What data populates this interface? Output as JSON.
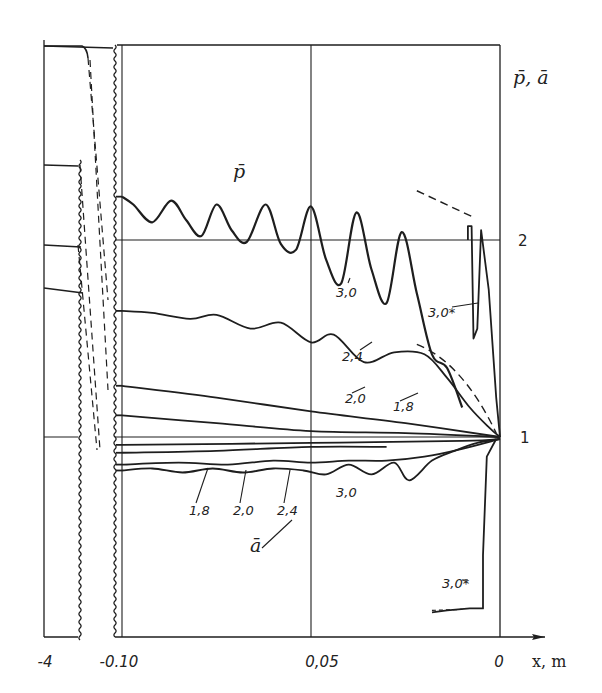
{
  "chart_data": {
    "type": "line",
    "title": "",
    "xlabel": "x, m",
    "ylabel": "p̄, ā",
    "xlim": [
      -0.1,
      0
    ],
    "ylim": [
      0,
      3
    ],
    "grid": true,
    "x_ticks": [
      "-4",
      "-0.10",
      "0,05",
      "0"
    ],
    "x_tick_values": [
      -4,
      -0.1,
      -0.05,
      0
    ],
    "y_ticks": [
      "1",
      "2"
    ],
    "y_tick_values": [
      1,
      2
    ],
    "x_axis_break": "between -4 and -0.10 (broken axis with inset segment at x=-4)",
    "group_labels": {
      "p": "p̄",
      "a": "ā"
    },
    "series": [
      {
        "name": "p̄ 3,0",
        "group": "p",
        "label": "3,0",
        "x": [
          -0.1,
          -0.097,
          -0.092,
          -0.087,
          -0.083,
          -0.079,
          -0.075,
          -0.071,
          -0.067,
          -0.062,
          -0.058,
          -0.054,
          -0.05,
          -0.046,
          -0.042,
          -0.038,
          -0.034,
          -0.03,
          -0.026,
          -0.022,
          -0.018,
          -0.014,
          -0.01
        ],
        "y": [
          2.22,
          2.18,
          2.09,
          2.2,
          2.1,
          2.02,
          2.18,
          2.05,
          1.99,
          2.18,
          1.98,
          1.95,
          2.17,
          1.9,
          1.78,
          2.14,
          1.85,
          1.68,
          2.04,
          1.73,
          1.42,
          1.35,
          1.15
        ]
      },
      {
        "name": "p̄ 3,0*",
        "group": "p",
        "label": "3,0*",
        "x": [
          -0.0085,
          -0.0085,
          -0.0075,
          -0.007,
          -0.006,
          -0.005,
          -0.003,
          -0.001,
          0
        ],
        "y": [
          2.0,
          2.07,
          2.07,
          1.5,
          1.55,
          2.05,
          1.75,
          1.2,
          1.0
        ]
      },
      {
        "name": "p̄ 2,4",
        "group": "p",
        "label": "2,4",
        "x": [
          -0.1,
          -0.092,
          -0.082,
          -0.075,
          -0.066,
          -0.058,
          -0.05,
          -0.044,
          -0.036,
          -0.028,
          -0.02,
          -0.014,
          -0.008,
          -0.003,
          0
        ],
        "y": [
          1.64,
          1.63,
          1.6,
          1.62,
          1.55,
          1.58,
          1.48,
          1.52,
          1.38,
          1.43,
          1.42,
          1.3,
          1.15,
          1.05,
          1.0
        ]
      },
      {
        "name": "p̄ 2,0",
        "group": "p",
        "label": "2,0",
        "x": [
          -0.1,
          -0.075,
          -0.05,
          -0.025,
          0
        ],
        "y": [
          1.26,
          1.2,
          1.13,
          1.07,
          1.0
        ]
      },
      {
        "name": "p̄ 1,8",
        "group": "p",
        "label": "1,8",
        "x": [
          -0.1,
          -0.075,
          -0.05,
          -0.025,
          0
        ],
        "y": [
          1.11,
          1.07,
          1.03,
          1.02,
          1.0
        ]
      },
      {
        "name": "ā 1,8",
        "group": "a",
        "label": "1,8",
        "x": [
          -0.1,
          -0.05,
          -0.01,
          0
        ],
        "y": [
          0.96,
          0.97,
          0.98,
          0.99
        ]
      },
      {
        "name": "ā 2,0",
        "group": "a",
        "label": "2,0",
        "x": [
          -0.1,
          -0.075,
          -0.05,
          -0.03
        ],
        "y": [
          0.92,
          0.93,
          0.95,
          0.95
        ]
      },
      {
        "name": "ā 2,4",
        "group": "a",
        "label": "2,4",
        "x": [
          -0.1,
          -0.085,
          -0.072,
          -0.06,
          -0.05,
          -0.04,
          -0.03,
          -0.02,
          -0.01,
          0
        ],
        "y": [
          0.86,
          0.87,
          0.86,
          0.88,
          0.87,
          0.88,
          0.88,
          0.9,
          0.94,
          0.99
        ]
      },
      {
        "name": "ā 3,0",
        "group": "a",
        "label": "3,0",
        "x": [
          -0.1,
          -0.092,
          -0.084,
          -0.076,
          -0.068,
          -0.06,
          -0.052,
          -0.046,
          -0.04,
          -0.034,
          -0.028,
          -0.024,
          -0.018,
          -0.012,
          -0.006,
          0
        ],
        "y": [
          0.83,
          0.84,
          0.82,
          0.84,
          0.82,
          0.84,
          0.83,
          0.81,
          0.86,
          0.81,
          0.87,
          0.78,
          0.88,
          0.93,
          0.97,
          0.99
        ]
      },
      {
        "name": "ā 3,0*",
        "group": "a",
        "label": "3,0*",
        "x": [
          -0.001,
          -0.0035,
          -0.0045,
          -0.0045,
          -0.008,
          -0.014,
          -0.018
        ],
        "y": [
          0.99,
          0.9,
          0.4,
          0.13,
          0.13,
          0.12,
          0.11
        ]
      }
    ],
    "annotations": [
      "3,0",
      "3,0*",
      "2,4",
      "2,0",
      "1,8",
      "1,8",
      "2,0",
      "2,4",
      "3,0",
      "3,0*",
      "p̄",
      "ā"
    ]
  }
}
